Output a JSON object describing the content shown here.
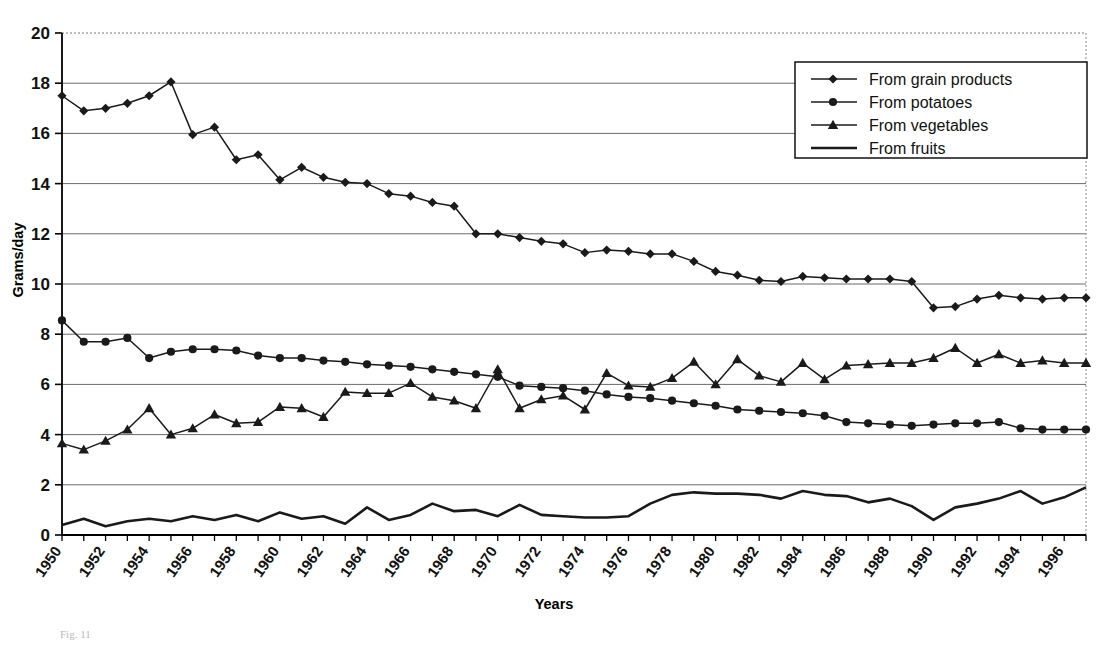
{
  "figure": {
    "caption_fragment": "Fig. 11",
    "xlabel": "Years",
    "ylabel": "Grams/day"
  },
  "legend": {
    "position": "top-right",
    "items": [
      {
        "label": "From grain products",
        "marker": "diamond"
      },
      {
        "label": "From potatoes",
        "marker": "circle"
      },
      {
        "label": "From vegetables",
        "marker": "triangle"
      },
      {
        "label": "From fruits",
        "marker": "none"
      }
    ]
  },
  "chart_data": {
    "type": "line",
    "title": "",
    "xlabel": "Years",
    "ylabel": "Grams/day",
    "xlim": [
      1950,
      1997
    ],
    "ylim": [
      0,
      20
    ],
    "ytick_step": 2,
    "yticks": [
      0,
      2,
      4,
      6,
      8,
      10,
      12,
      14,
      16,
      18,
      20
    ],
    "xtick_labels": [
      "1950",
      "1952",
      "1954",
      "1956",
      "1958",
      "1960",
      "1962",
      "1964",
      "1966",
      "1968",
      "1970",
      "1972",
      "1974",
      "1976",
      "1978",
      "1980",
      "1982",
      "1984",
      "1986",
      "1988",
      "1990",
      "1992",
      "1994",
      "1996"
    ],
    "xtick_label_rotation": -55,
    "grid": "horizontal",
    "legend_position": "upper right",
    "line_color": "#1a1a1a",
    "x": [
      1950,
      1951,
      1952,
      1953,
      1954,
      1955,
      1956,
      1957,
      1958,
      1959,
      1960,
      1961,
      1962,
      1963,
      1964,
      1965,
      1966,
      1967,
      1968,
      1969,
      1970,
      1971,
      1972,
      1973,
      1974,
      1975,
      1976,
      1977,
      1978,
      1979,
      1980,
      1981,
      1982,
      1983,
      1984,
      1985,
      1986,
      1987,
      1988,
      1989,
      1990,
      1991,
      1992,
      1993,
      1994,
      1995,
      1996,
      1997
    ],
    "series": [
      {
        "name": "From grain products",
        "marker": "diamond",
        "values": [
          17.5,
          16.9,
          17.0,
          17.2,
          17.5,
          18.05,
          15.95,
          16.25,
          14.95,
          15.15,
          14.15,
          14.65,
          14.25,
          14.05,
          14.0,
          13.6,
          13.5,
          13.25,
          13.1,
          12.0,
          12.0,
          11.85,
          11.7,
          11.6,
          11.25,
          11.35,
          11.3,
          11.2,
          11.2,
          10.9,
          10.5,
          10.35,
          10.15,
          10.1,
          10.3,
          10.25,
          10.2,
          10.2,
          10.2,
          10.1,
          9.05,
          9.1,
          9.4,
          9.55,
          9.45,
          9.4,
          9.45,
          9.45
        ]
      },
      {
        "name": "From potatoes",
        "marker": "circle",
        "values": [
          8.55,
          7.7,
          7.7,
          7.85,
          7.05,
          7.3,
          7.4,
          7.4,
          7.35,
          7.15,
          7.05,
          7.05,
          6.95,
          6.9,
          6.8,
          6.75,
          6.7,
          6.6,
          6.5,
          6.4,
          6.3,
          5.95,
          5.9,
          5.85,
          5.75,
          5.6,
          5.5,
          5.45,
          5.35,
          5.25,
          5.15,
          5.0,
          4.95,
          4.9,
          4.85,
          4.75,
          4.5,
          4.45,
          4.4,
          4.35,
          4.4,
          4.45,
          4.45,
          4.5,
          4.25,
          4.2,
          4.2,
          4.2
        ]
      },
      {
        "name": "From vegetables",
        "marker": "triangle",
        "values": [
          3.65,
          3.4,
          3.75,
          4.2,
          5.05,
          4.0,
          4.25,
          4.8,
          4.45,
          4.5,
          5.1,
          5.05,
          4.7,
          5.7,
          5.65,
          5.65,
          6.05,
          5.5,
          5.35,
          5.05,
          6.6,
          5.05,
          5.4,
          5.55,
          5.0,
          6.45,
          5.95,
          5.9,
          6.25,
          6.9,
          6.0,
          7.0,
          6.35,
          6.1,
          6.85,
          6.2,
          6.75,
          6.8,
          6.85,
          6.85,
          7.05,
          7.45,
          6.85,
          7.2,
          6.85,
          6.95,
          6.85,
          6.85
        ]
      },
      {
        "name": "From fruits",
        "marker": "none",
        "values": [
          0.4,
          0.65,
          0.35,
          0.55,
          0.65,
          0.55,
          0.75,
          0.6,
          0.8,
          0.55,
          0.9,
          0.65,
          0.75,
          0.45,
          1.1,
          0.6,
          0.8,
          1.25,
          0.95,
          1.0,
          0.75,
          1.2,
          0.8,
          0.75,
          0.7,
          0.7,
          0.75,
          1.25,
          1.6,
          1.7,
          1.65,
          1.65,
          1.6,
          1.45,
          1.75,
          1.6,
          1.55,
          1.3,
          1.45,
          1.15,
          0.6,
          1.1,
          1.25,
          1.45,
          1.75,
          1.25,
          1.5,
          1.9
        ]
      }
    ]
  }
}
